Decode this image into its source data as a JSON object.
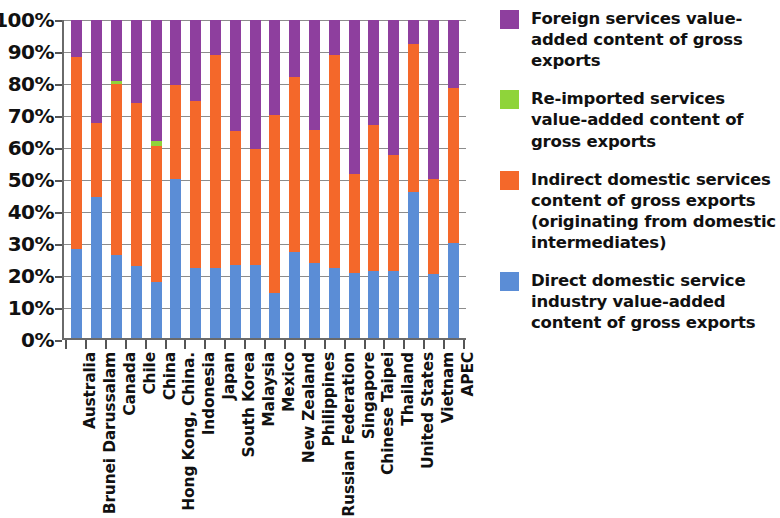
{
  "chart_data": {
    "type": "bar",
    "title": "",
    "subtitle": "",
    "xlabel": "",
    "ylabel": "",
    "stacked": true,
    "grid": true,
    "legend_position": "right",
    "ylim": [
      0,
      100
    ],
    "ytick_labels": [
      "100%",
      "90%",
      "80%",
      "70%",
      "60%",
      "50%",
      "40%",
      "30%",
      "20%",
      "10%",
      "0%"
    ],
    "ytick_values": [
      100,
      90,
      80,
      70,
      60,
      50,
      40,
      30,
      20,
      10,
      0
    ],
    "categories": [
      "Australia",
      "Brunei Darussalam",
      "Canada",
      "Chile",
      "China",
      "Hong Kong, China.",
      "Indonesia",
      "Japan",
      "South Korea",
      "Malaysia",
      "Mexico",
      "New Zealand",
      "Philippines",
      "Russian Federation",
      "Singapore",
      "Chinese Taipei",
      "Thailand",
      "United States",
      "Vietnam",
      "APEC"
    ],
    "series": [
      {
        "name": "Direct domestic service industry value-added content of gross exports",
        "color": "#5b8dd6",
        "values": [
          28.0,
          44.5,
          26.0,
          22.5,
          17.5,
          50.0,
          22.0,
          22.0,
          23.0,
          23.0,
          14.0,
          27.0,
          23.5,
          22.0,
          20.5,
          21.0,
          21.0,
          46.0,
          20.0,
          30.0
        ]
      },
      {
        "name": "Indirect domestic services content of gross exports (originating from domestic intermediates)",
        "color": "#f4682a",
        "values": [
          60.5,
          23.0,
          54.0,
          51.5,
          43.0,
          29.5,
          52.5,
          67.0,
          42.0,
          36.5,
          56.0,
          55.0,
          42.0,
          67.0,
          31.0,
          46.0,
          36.5,
          46.5,
          30.0,
          48.5
        ]
      },
      {
        "name": "Re-imported services value-added content of gross exports",
        "color": "#8fd43a",
        "values": [
          0.0,
          0.0,
          0.8,
          0.0,
          1.5,
          0.0,
          0.0,
          0.0,
          0.0,
          0.0,
          0.0,
          0.0,
          0.0,
          0.0,
          0.0,
          0.0,
          0.0,
          0.0,
          0.0,
          0.0
        ]
      },
      {
        "name": "Foreign services value-added content of gross exports",
        "color": "#8e3f9e",
        "values": [
          11.5,
          32.5,
          19.2,
          26.0,
          38.0,
          20.5,
          25.5,
          11.0,
          35.0,
          40.5,
          30.0,
          18.0,
          34.5,
          11.0,
          48.5,
          33.0,
          42.5,
          7.5,
          50.0,
          21.5
        ]
      }
    ]
  },
  "legend": {
    "items": [
      {
        "label": "Foreign services value-added content of gross exports",
        "color": "#8e3f9e",
        "swatch_class": "sw-foreign"
      },
      {
        "label": "Re-imported services value-added content of gross exports",
        "color": "#8fd43a",
        "swatch_class": "sw-reimp"
      },
      {
        "label": "Indirect domestic services content of gross exports (originating from domestic intermediates)",
        "color": "#f4682a",
        "swatch_class": "sw-indirect"
      },
      {
        "label": "Direct domestic service industry value-added content of gross exports",
        "color": "#5b8dd6",
        "swatch_class": "sw-direct"
      }
    ]
  }
}
